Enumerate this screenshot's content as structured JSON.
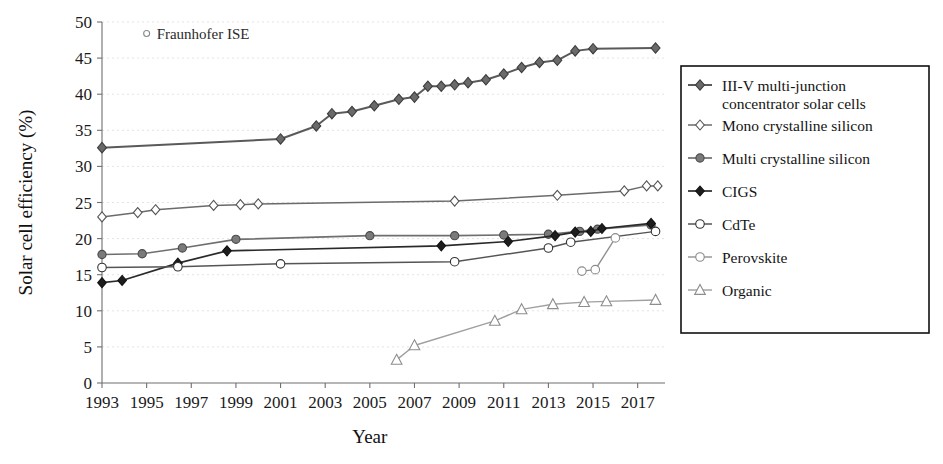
{
  "chart_data": {
    "type": "line",
    "title": "",
    "xlabel": "Year",
    "ylabel": "Solar cell efficiency (%)",
    "xlim": [
      1993,
      2018
    ],
    "ylim": [
      0,
      50
    ],
    "ytick_step": 5,
    "xtick_step": 2,
    "grid": true,
    "legend_position": "right-outside",
    "xticks": [
      "1993",
      "1995",
      "1997",
      "1999",
      "2001",
      "2003",
      "2005",
      "2007",
      "2009",
      "2011",
      "2013",
      "2015",
      "2017"
    ],
    "yticks": [
      "0",
      "5",
      "10",
      "15",
      "20",
      "25",
      "30",
      "35",
      "40",
      "45",
      "50"
    ],
    "annotations": [
      {
        "text": "Fraunhofer ISE",
        "marker": "open-circle-small",
        "x": 1995.0,
        "y": 48.4
      }
    ],
    "series": [
      {
        "name": "III-V multi-junction concentrator solar cells",
        "marker": "filled-diamond",
        "color": "#5a5a5a",
        "marker_fill": "#6a6a6a",
        "marker_stroke": "#3c3c3c",
        "marker_size": 5.2,
        "line_width": 2.0,
        "x": [
          1993,
          2001,
          2002.6,
          2003.3,
          2004.2,
          2005.2,
          2006.3,
          2007.0,
          2007.6,
          2008.2,
          2008.8,
          2009.4,
          2010.2,
          2011.0,
          2011.8,
          2012.6,
          2013.4,
          2014.2,
          2015.0,
          2017.8
        ],
        "y": [
          32.6,
          33.8,
          35.6,
          37.3,
          37.6,
          38.4,
          39.3,
          39.6,
          41.1,
          41.1,
          41.3,
          41.6,
          42.0,
          42.8,
          43.7,
          44.4,
          44.7,
          46.0,
          46.3,
          46.4
        ]
      },
      {
        "name": "Mono crystalline silicon",
        "marker": "open-diamond",
        "color": "#6b6b6b",
        "marker_fill": "#ffffff",
        "marker_stroke": "#555555",
        "marker_size": 5.0,
        "line_width": 1.5,
        "x": [
          1993,
          1994.6,
          1995.4,
          1998.0,
          1999.2,
          2000.0,
          2008.8,
          2013.4,
          2016.4,
          2017.4,
          2017.9
        ],
        "y": [
          23.0,
          23.6,
          24.0,
          24.6,
          24.7,
          24.8,
          25.2,
          26.0,
          26.6,
          27.3,
          27.3
        ]
      },
      {
        "name": "Multi crystalline silicon",
        "marker": "filled-circle",
        "color": "#6f6f6f",
        "marker_fill": "#7a7a7a",
        "marker_stroke": "#4a4a4a",
        "marker_size": 5.0,
        "line_width": 1.7,
        "x": [
          1993,
          1994.8,
          1996.6,
          1999.0,
          2005.0,
          2008.8,
          2011.0,
          2013.0,
          2014.4,
          2015.2,
          2017.6
        ],
        "y": [
          17.8,
          17.9,
          18.7,
          19.9,
          20.4,
          20.4,
          20.5,
          20.6,
          21.0,
          21.3,
          21.9
        ]
      },
      {
        "name": "CIGS",
        "marker": "filled-diamond",
        "color": "#2a2a2a",
        "marker_fill": "#1d1d1d",
        "marker_stroke": "#111111",
        "marker_size": 5.0,
        "line_width": 1.7,
        "x": [
          1993,
          1993.9,
          1996.4,
          1998.6,
          2008.2,
          2011.2,
          2013.3,
          2014.2,
          2014.9,
          2015.4,
          2017.6
        ],
        "y": [
          13.9,
          14.2,
          16.6,
          18.3,
          19.0,
          19.6,
          20.4,
          20.9,
          21.0,
          21.4,
          22.1
        ]
      },
      {
        "name": "CdTe",
        "marker": "open-circle",
        "color": "#555555",
        "marker_fill": "#ffffff",
        "marker_stroke": "#333333",
        "marker_size": 5.2,
        "line_width": 1.5,
        "x": [
          1993,
          1996.4,
          2001.0,
          2008.8,
          2013.0,
          2014.0,
          2017.8
        ],
        "y": [
          16.0,
          16.1,
          16.5,
          16.8,
          18.7,
          19.5,
          21.0
        ]
      },
      {
        "name": "Perovskite",
        "marker": "open-circle",
        "color": "#909090",
        "marker_fill": "#ffffff",
        "marker_stroke": "#8a8a8a",
        "marker_size": 5.2,
        "line_width": 1.4,
        "x": [
          2014.5,
          2015.1,
          2016.0
        ],
        "y": [
          15.5,
          15.7,
          20.1
        ]
      },
      {
        "name": "Organic",
        "marker": "open-triangle",
        "color": "#a0a0a0",
        "marker_fill": "#ffffff",
        "marker_stroke": "#8d8d8d",
        "marker_size": 5.6,
        "line_width": 1.4,
        "x": [
          2006.2,
          2007.0,
          2010.6,
          2011.8,
          2013.2,
          2014.6,
          2015.6,
          2017.8
        ],
        "y": [
          3.2,
          5.2,
          8.6,
          10.2,
          10.9,
          11.2,
          11.3,
          11.5
        ]
      }
    ]
  },
  "legend": {
    "items": [
      {
        "label_line1": "III-V multi-junction",
        "label_line2": "concentrator solar cells"
      },
      {
        "label_line1": "Mono crystalline silicon",
        "label_line2": ""
      },
      {
        "label_line1": "Multi crystalline silicon",
        "label_line2": ""
      },
      {
        "label_line1": "CIGS",
        "label_line2": ""
      },
      {
        "label_line1": "CdTe",
        "label_line2": ""
      },
      {
        "label_line1": "Perovskite",
        "label_line2": ""
      },
      {
        "label_line1": "Organic",
        "label_line2": ""
      }
    ]
  }
}
